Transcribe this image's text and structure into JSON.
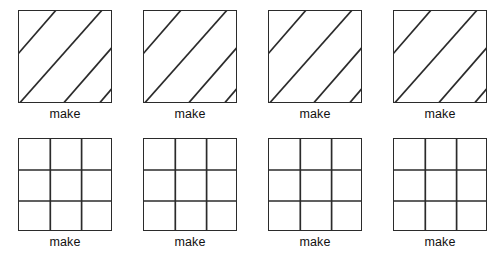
{
  "page": {
    "background_color": "#ffffff",
    "stroke_color": "#2b2b2b",
    "text_color": "#111111",
    "rows": 2,
    "columns": 4
  },
  "figures": {
    "hatched": {
      "shape_name": "square",
      "pattern": "diagonal-stripes",
      "direction": "bottom-left-to-top-right",
      "line_count": 4,
      "label": "make"
    },
    "grid": {
      "shape_name": "square",
      "pattern": "3x3-grid",
      "rows": 3,
      "columns": 3,
      "label": "make"
    }
  },
  "items": [
    {
      "id": "hatched-1",
      "type": "hatched",
      "label": "make"
    },
    {
      "id": "hatched-2",
      "type": "hatched",
      "label": "make"
    },
    {
      "id": "hatched-3",
      "type": "hatched",
      "label": "make"
    },
    {
      "id": "hatched-4",
      "type": "hatched",
      "label": "make"
    },
    {
      "id": "grid-1",
      "type": "grid",
      "label": "make"
    },
    {
      "id": "grid-2",
      "type": "grid",
      "label": "make"
    },
    {
      "id": "grid-3",
      "type": "grid",
      "label": "make"
    },
    {
      "id": "grid-4",
      "type": "grid",
      "label": "make"
    }
  ]
}
